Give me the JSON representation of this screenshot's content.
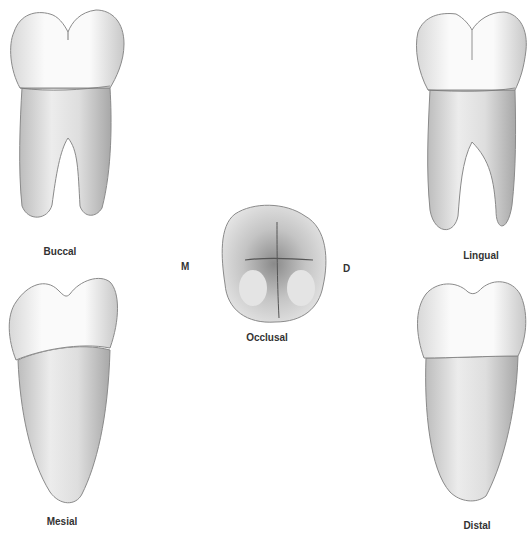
{
  "figure": {
    "views": [
      {
        "id": "buccal",
        "label": "Buccal"
      },
      {
        "id": "lingual",
        "label": "Lingual"
      },
      {
        "id": "occlusal",
        "label": "Occlusal"
      },
      {
        "id": "mesial",
        "label": "Mesial"
      },
      {
        "id": "distal",
        "label": "Distal"
      }
    ],
    "orientation": {
      "left": "M",
      "right": "D"
    }
  },
  "colors": {
    "background": "#ffffff",
    "enamel": "#f4f4f4",
    "root": "#d9d9d9",
    "outline": "#8a8a8a",
    "label": "#333333"
  }
}
